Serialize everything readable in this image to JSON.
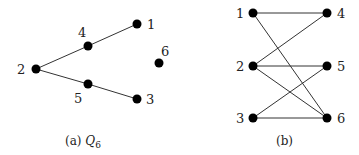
{
  "figure_a": {
    "caption_prefix": "(a) ",
    "caption_symbol": "Q",
    "caption_sub": "6",
    "nodes": [
      {
        "id": "1",
        "x": 137,
        "y": 24,
        "lx": 147,
        "ly": 29
      },
      {
        "id": "2",
        "x": 36,
        "y": 69,
        "lx": 17,
        "ly": 74
      },
      {
        "id": "3",
        "x": 137,
        "y": 99,
        "lx": 146,
        "ly": 104
      },
      {
        "id": "4",
        "x": 88,
        "y": 46,
        "lx": 78,
        "ly": 37
      },
      {
        "id": "5",
        "x": 88,
        "y": 84,
        "lx": 74,
        "ly": 103
      },
      {
        "id": "6",
        "x": 159,
        "y": 63,
        "lx": 161,
        "ly": 56
      }
    ],
    "edges": [
      [
        "2",
        "4"
      ],
      [
        "4",
        "1"
      ],
      [
        "2",
        "5"
      ],
      [
        "5",
        "3"
      ]
    ]
  },
  "figure_b": {
    "caption": "(b)",
    "nodes": [
      {
        "id": "1",
        "x": 253,
        "y": 13,
        "lx": 236,
        "ly": 18
      },
      {
        "id": "2",
        "x": 253,
        "y": 66,
        "lx": 236,
        "ly": 71
      },
      {
        "id": "3",
        "x": 253,
        "y": 118,
        "lx": 236,
        "ly": 123
      },
      {
        "id": "4",
        "x": 327,
        "y": 13,
        "lx": 337,
        "ly": 18
      },
      {
        "id": "5",
        "x": 327,
        "y": 66,
        "lx": 337,
        "ly": 71
      },
      {
        "id": "6",
        "x": 327,
        "y": 118,
        "lx": 337,
        "ly": 123
      }
    ],
    "edges": [
      [
        "1",
        "4"
      ],
      [
        "1",
        "6"
      ],
      [
        "2",
        "4"
      ],
      [
        "2",
        "5"
      ],
      [
        "2",
        "6"
      ],
      [
        "3",
        "5"
      ],
      [
        "3",
        "6"
      ]
    ]
  }
}
